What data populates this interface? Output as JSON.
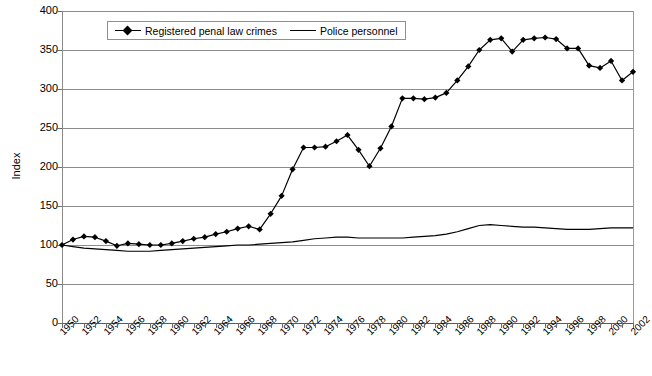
{
  "chart_data": {
    "type": "line",
    "title": "",
    "xlabel": "",
    "ylabel": "Index",
    "ylim": [
      0,
      400
    ],
    "ytick_values": [
      0,
      50,
      100,
      150,
      200,
      250,
      300,
      350,
      400
    ],
    "ytick_labels": [
      "0",
      "50",
      "100",
      "150",
      "200",
      "250",
      "300",
      "350",
      "400"
    ],
    "grid": true,
    "legend_position": "top-center-inside",
    "xlim": [
      1950,
      2002
    ],
    "x": [
      1950,
      1951,
      1952,
      1953,
      1954,
      1955,
      1956,
      1957,
      1958,
      1959,
      1960,
      1961,
      1962,
      1963,
      1964,
      1965,
      1966,
      1967,
      1968,
      1969,
      1970,
      1971,
      1972,
      1973,
      1974,
      1975,
      1976,
      1977,
      1978,
      1979,
      1980,
      1981,
      1982,
      1983,
      1984,
      1985,
      1986,
      1987,
      1988,
      1989,
      1990,
      1991,
      1992,
      1993,
      1994,
      1995,
      1996,
      1997,
      1998,
      1999,
      2000,
      2001,
      2002
    ],
    "xtick_labels": [
      "1950",
      "1952",
      "1954",
      "1956",
      "1958",
      "1960",
      "1962",
      "1964",
      "1966",
      "1968",
      "1970",
      "1972",
      "1974",
      "1976",
      "1978",
      "1980",
      "1982",
      "1984",
      "1986",
      "1988",
      "1990",
      "1992",
      "1994",
      "1996",
      "1998",
      "2000",
      "2002"
    ],
    "xtick_step": 2,
    "series": [
      {
        "name": "Registered penal law crimes",
        "marker": "diamond",
        "color": "#000000",
        "values": [
          100,
          107,
          111,
          110,
          105,
          99,
          102,
          101,
          100,
          100,
          102,
          105,
          108,
          110,
          114,
          117,
          121,
          124,
          120,
          140,
          163,
          197,
          225,
          225,
          226,
          233,
          241,
          222,
          201,
          224,
          252,
          288,
          288,
          287,
          289,
          295,
          311,
          329,
          350,
          363,
          365,
          348,
          363,
          365,
          366,
          364,
          352,
          352,
          330,
          327,
          336,
          311,
          322
        ]
      },
      {
        "name": "Police personnel",
        "marker": "none",
        "color": "#000000",
        "values": [
          100,
          98,
          96,
          95,
          94,
          93,
          92,
          92,
          92,
          93,
          94,
          95,
          96,
          97,
          98,
          99,
          100,
          100,
          101,
          102,
          103,
          104,
          106,
          108,
          109,
          110,
          110,
          109,
          109,
          109,
          109,
          109,
          110,
          111,
          112,
          114,
          117,
          121,
          125,
          126,
          125,
          124,
          123,
          123,
          122,
          121,
          120,
          120,
          120,
          121,
          122,
          122,
          122
        ]
      }
    ]
  },
  "axes": {
    "y_title": "Index"
  },
  "legend": {
    "items": [
      {
        "label": "Registered penal law crimes",
        "style": "line-diamond"
      },
      {
        "label": "Police personnel",
        "style": "line"
      }
    ]
  }
}
